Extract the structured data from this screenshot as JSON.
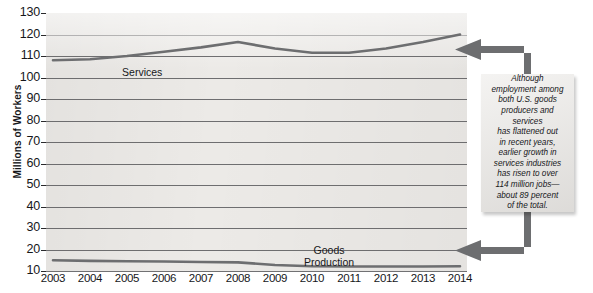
{
  "chart_data": {
    "type": "line",
    "title": "",
    "xlabel": "",
    "ylabel": "Millions of Workers",
    "categories": [
      "2003",
      "2004",
      "2005",
      "2006",
      "2007",
      "2008",
      "2009",
      "2010",
      "2011",
      "2012",
      "2013",
      "2014"
    ],
    "x": [
      2003,
      2004,
      2005,
      2006,
      2007,
      2008,
      2009,
      2010,
      2011,
      2012,
      2013,
      2014
    ],
    "ylim": [
      10,
      130
    ],
    "ytick_step": 10,
    "yticks": [
      130,
      120,
      110,
      100,
      90,
      80,
      70,
      60,
      50,
      40,
      30,
      20,
      10
    ],
    "grid": true,
    "legend": "inline-labels",
    "series": [
      {
        "name": "Services",
        "values": [
          108,
          108.5,
          110,
          112,
          114,
          116.5,
          113.5,
          111.5,
          111.5,
          113.5,
          116.5,
          120
        ]
      },
      {
        "name": "Goods\nProduction",
        "values": [
          15,
          14.7,
          14.5,
          14.4,
          14.2,
          14.0,
          12.8,
          12.2,
          12.1,
          12.1,
          12.1,
          12.2
        ]
      }
    ],
    "annotations": [
      {
        "name": "callout",
        "text": "Although\nemployment among\nboth U.S. goods\nproducers and\nservices\nhas flattened out\nin recent years,\nearlier growth in\nservices industries\nhas risen to over\n114 million jobs—\nabout 89 percent\nof the total.",
        "points_to": [
          "Services",
          "Goods Production"
        ]
      }
    ],
    "colors": {
      "plot_background": "#eceae7",
      "gridline": "#58585a",
      "series_line": "#6d6e70",
      "callout_background": "#e9e7e4",
      "arrow": "#6d6e70",
      "text": "#16171a"
    }
  },
  "axis": {
    "y_title": "Millions of Workers",
    "y_labels": [
      "130",
      "120",
      "110",
      "100",
      "90",
      "80",
      "70",
      "60",
      "50",
      "40",
      "30",
      "20",
      "10"
    ],
    "x_labels": [
      "2003",
      "2004",
      "2005",
      "2006",
      "2007",
      "2008",
      "2009",
      "2010",
      "2011",
      "2012",
      "2013",
      "2014"
    ]
  },
  "series_labels": {
    "services": "Services",
    "goods": "Goods\nProduction"
  },
  "callout": {
    "text": "Although\nemployment among\nboth U.S. goods\nproducers and\nservices\nhas flattened out\nin recent years,\nearlier growth in\nservices industries\nhas risen to over\n114 million jobs—\nabout 89 percent\nof the total."
  }
}
